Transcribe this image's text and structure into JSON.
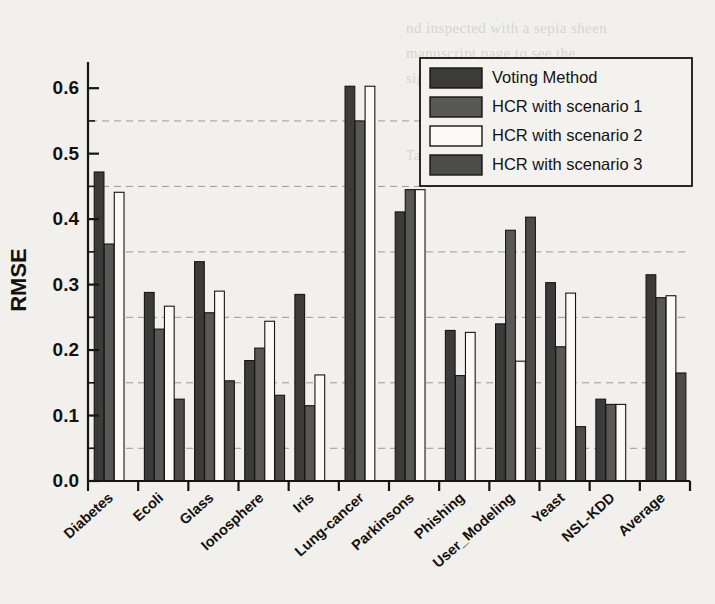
{
  "chart_data": {
    "type": "bar",
    "title": "",
    "xlabel": "",
    "ylabel": "RMSE",
    "ylim": [
      0.0,
      0.64
    ],
    "yticks": [
      0.0,
      0.1,
      0.2,
      0.3,
      0.4,
      0.5,
      0.6
    ],
    "ytick_labels": [
      "0.0",
      "0.1",
      "0.2",
      "0.3",
      "0.4",
      "0.5",
      "0.6"
    ],
    "minor_ticks": true,
    "grid": "horizontal-dashed",
    "legend_position": "top-right",
    "categories": [
      "Diabetes",
      "Ecoli",
      "Glass",
      "Ionosphere",
      "Iris",
      "Lung-cancer",
      "Parkinsons",
      "Phishing",
      "User_Modeling",
      "Yeast",
      "NSL-KDD",
      "Average"
    ],
    "series": [
      {
        "name": "Voting Method",
        "color": "#3b3b3b",
        "values": [
          0.472,
          0.288,
          0.335,
          0.184,
          0.285,
          0.603,
          0.411,
          0.23,
          0.24,
          0.303,
          0.125,
          0.315
        ]
      },
      {
        "name": "HCR with scenario 1",
        "color": "#585858",
        "values": [
          0.362,
          0.232,
          0.257,
          0.203,
          0.115,
          0.55,
          0.445,
          0.161,
          0.383,
          0.205,
          0.117,
          0.28
        ]
      },
      {
        "name": "HCR with scenario 2",
        "color": "#fbfaf6",
        "values": [
          0.441,
          0.267,
          0.29,
          0.244,
          0.162,
          0.603,
          0.445,
          0.227,
          0.183,
          0.287,
          0.117,
          0.283
        ]
      },
      {
        "name": "HCR with scenario 3",
        "color": "#4c4c4c",
        "values": [
          0.0,
          0.125,
          0.153,
          0.131,
          0.0,
          0.0,
          0.0,
          0.0,
          0.403,
          0.083,
          0.0,
          0.165
        ]
      }
    ]
  },
  "background_text": {
    "line1": "nd inspected with a sepia sheen",
    "line2": "manuscript page to see the",
    "line3": "sign text pages also",
    "line4": "Table 8 the aggregated results of"
  }
}
